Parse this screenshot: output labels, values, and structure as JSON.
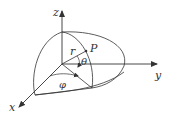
{
  "diagram": {
    "type": "spherical-coordinates",
    "labels": {
      "z_axis": "z",
      "y_axis": "y",
      "x_axis": "x",
      "radius": "r",
      "point": "P",
      "polar_angle": "θ",
      "azimuthal_angle": "φ"
    },
    "colors": {
      "stroke": "#333333",
      "background": "#ffffff"
    }
  }
}
